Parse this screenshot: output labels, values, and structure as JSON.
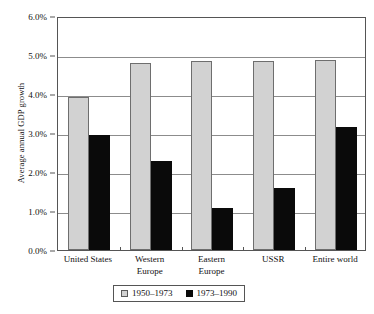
{
  "chart_data": {
    "type": "bar",
    "title": "",
    "xlabel": "",
    "ylabel": "Average annual GDP growth",
    "ylim": [
      0,
      6
    ],
    "ytick_labels": [
      "0.0%",
      "1.0%",
      "2.0%",
      "3.0%",
      "4.0%",
      "5.0%",
      "6.0%"
    ],
    "ytick_values": [
      0,
      1,
      2,
      3,
      4,
      5,
      6
    ],
    "grid": true,
    "legend_position": "bottom",
    "categories": [
      "United States",
      "Western Europe",
      "Eastern Europe",
      "USSR",
      "Entire world"
    ],
    "category_lines": [
      [
        "United States"
      ],
      [
        "Western",
        "Europe"
      ],
      [
        "Eastern",
        "Europe"
      ],
      [
        "USSR"
      ],
      [
        "Entire world"
      ]
    ],
    "series": [
      {
        "name": "1950–1973",
        "color": "#d2d2d2",
        "values": [
          3.93,
          4.79,
          4.84,
          4.84,
          4.88
        ]
      },
      {
        "name": "1973–1990",
        "color": "#0a0a0a",
        "values": [
          2.95,
          2.28,
          1.07,
          1.6,
          3.15
        ]
      }
    ]
  },
  "legend": {
    "items": [
      {
        "label": "1950–1973",
        "swatch": "gray-square-icon"
      },
      {
        "label": "1973–1990",
        "swatch": "black-square-icon"
      }
    ]
  }
}
